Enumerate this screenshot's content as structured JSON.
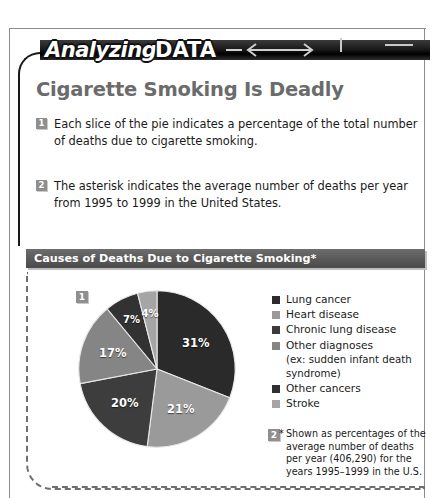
{
  "banner": {
    "word_one": "Analyzing",
    "word_two": "DATA",
    "arrow_icon": "double-arrow-icon"
  },
  "headline": "Cigarette Smoking Is Deadly",
  "notes": [
    {
      "number": "1",
      "text": "Each slice of the pie indicates a percentage of the total number of deaths due to cigarette smoking."
    },
    {
      "number": "2",
      "text": "The asterisk indicates the average number of deaths per year from 1995 to 1999 in the United States."
    }
  ],
  "figure": {
    "title": "Causes of Deaths Due to Cigarette Smoking*",
    "pie_badge": "1",
    "footnote_badge": "2",
    "footnote_marker": "*",
    "footnote": "Shown as percentages of the average number of deaths per year (406,290) for the years 1995–1999 in the U.S."
  },
  "chart_data": {
    "type": "pie",
    "title": "Causes of Deaths Due to Cigarette Smoking*",
    "legend_position": "right",
    "categories": [
      "Lung cancer",
      "Heart disease",
      "Chronic lung disease",
      "Other diagnoses",
      "Other cancers",
      "Stroke"
    ],
    "legend_labels": [
      "Lung cancer",
      "Heart disease",
      "Chronic lung disease",
      "Other diagnoses",
      "Other cancers",
      "Stroke"
    ],
    "legend_sublabel_index": 3,
    "legend_sublabel": "(ex: sudden infant death syndrome)",
    "values": [
      31,
      21,
      20,
      17,
      7,
      4
    ],
    "data_labels": [
      "31%",
      "21%",
      "20%",
      "17%",
      "7%",
      "4%"
    ],
    "colors": [
      "#2b2b2b",
      "#9a9a9a",
      "#3c3c3c",
      "#858585",
      "#303030",
      "#a5a5a5"
    ],
    "total_deaths_per_year": "406,290",
    "years": "1995–1999",
    "region": "U.S.",
    "units": "percent of total deaths"
  }
}
